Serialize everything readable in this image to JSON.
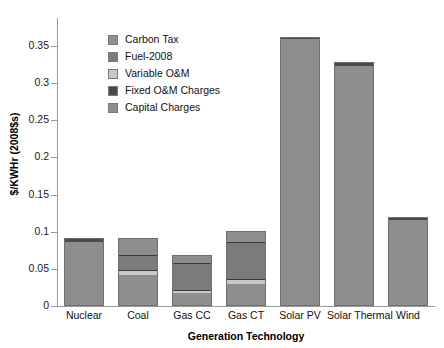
{
  "chart_data": {
    "type": "bar",
    "subtype": "stacked-bar",
    "title": "",
    "xlabel": "Generation Technology",
    "ylabel": "$/KWHr (2008$s)",
    "ylim": [
      0,
      0.4
    ],
    "ytick_labels": [
      "0",
      "0.05",
      "0.1",
      "0.15",
      "0.2",
      "0.25",
      "0.3",
      "0.35"
    ],
    "ytick_values": [
      0,
      0.05,
      0.1,
      0.15,
      0.2,
      0.25,
      0.3,
      0.35
    ],
    "grid": false,
    "legend_position": "inside-upper-left",
    "categories": [
      "Nuclear",
      "Coal",
      "Gas CC",
      "Gas CT",
      "Solar PV",
      "Solar Thermal",
      "Wind"
    ],
    "series": [
      {
        "name": "Capital Charges",
        "color": "#8e8e8e",
        "values": [
          0.085,
          0.041,
          0.016,
          0.028,
          0.358,
          0.322,
          0.114
        ]
      },
      {
        "name": "Fixed O&M Charges",
        "color": "#4a4a4a",
        "values": [
          0.006,
          0.0,
          0.0,
          0.0,
          0.004,
          0.006,
          0.006
        ]
      },
      {
        "name": "Variable O&M",
        "color": "#c9c9c9",
        "values": [
          0.001,
          0.006,
          0.004,
          0.007,
          0.0,
          0.0,
          0.0
        ]
      },
      {
        "name": "Fuel-2008",
        "color": "#7b7b7b",
        "values": [
          0.0,
          0.021,
          0.036,
          0.05,
          0.0,
          0.0,
          0.0
        ]
      },
      {
        "name": "Carbon Tax",
        "color": "#8e8e8e",
        "values": [
          0.0,
          0.024,
          0.013,
          0.016,
          0.0,
          0.0,
          0.0
        ]
      }
    ],
    "totals": [
      0.092,
      0.092,
      0.069,
      0.101,
      0.362,
      0.328,
      0.12
    ]
  },
  "legend": {
    "items": [
      {
        "label": "Carbon Tax",
        "color": "#8e8e8e"
      },
      {
        "label": "Fuel-2008",
        "color": "#7b7b7b"
      },
      {
        "label": "Variable O&M",
        "color": "#c9c9c9"
      },
      {
        "label": "Fixed O&M Charges",
        "color": "#4a4a4a"
      },
      {
        "label": "Capital Charges",
        "color": "#8e8e8e"
      }
    ]
  },
  "axes": {
    "y_title": "$/KWHr (2008$s)",
    "x_title": "Generation Technology",
    "y_ticks": [
      "0.35",
      "0.3",
      "0.25",
      "0.2",
      "0.15",
      "0.1",
      "0.05",
      "0"
    ]
  }
}
